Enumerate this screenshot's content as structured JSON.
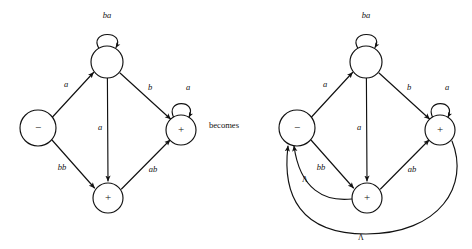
{
  "figure": {
    "connector_text": "becomes",
    "stroke_color": "#111111",
    "background_color": "#ffffff"
  },
  "left_automaton": {
    "name": "original-automaton",
    "nodes": [
      {
        "id": "start",
        "label": "−",
        "cx": 38,
        "cy": 128,
        "r": 18
      },
      {
        "id": "top",
        "label": "",
        "cx": 107,
        "cy": 62,
        "r": 16
      },
      {
        "id": "right",
        "label": "+",
        "cx": 181,
        "cy": 130,
        "r": 15
      },
      {
        "id": "bottom",
        "label": "+",
        "cx": 108,
        "cy": 198,
        "r": 15
      }
    ],
    "edges": [
      {
        "id": "top-self",
        "label": "ba",
        "label_x": 107,
        "label_y": 16
      },
      {
        "id": "start-top",
        "label": "a",
        "label_x": 66,
        "label_y": 85
      },
      {
        "id": "top-right",
        "label": "b",
        "label_x": 150,
        "label_y": 88
      },
      {
        "id": "right-self",
        "label": "a",
        "label_x": 188,
        "label_y": 88
      },
      {
        "id": "top-bottom",
        "label": "a",
        "label_x": 100,
        "label_y": 128
      },
      {
        "id": "start-bottom",
        "label": "bb",
        "label_x": 62,
        "label_y": 168
      },
      {
        "id": "bottom-right",
        "label": "ab",
        "label_x": 153,
        "label_y": 170
      }
    ]
  },
  "right_automaton": {
    "name": "transformed-automaton",
    "nodes": [
      {
        "id": "start",
        "label": "−",
        "cx": 297,
        "cy": 128,
        "r": 18
      },
      {
        "id": "top",
        "label": "",
        "cx": 366,
        "cy": 62,
        "r": 16
      },
      {
        "id": "right",
        "label": "+",
        "cx": 440,
        "cy": 130,
        "r": 15
      },
      {
        "id": "bottom",
        "label": "+",
        "cx": 367,
        "cy": 198,
        "r": 15
      }
    ],
    "edges": [
      {
        "id": "top-self",
        "label": "ba",
        "label_x": 366,
        "label_y": 16
      },
      {
        "id": "start-top",
        "label": "a",
        "label_x": 325,
        "label_y": 85
      },
      {
        "id": "top-right",
        "label": "b",
        "label_x": 409,
        "label_y": 88
      },
      {
        "id": "right-self",
        "label": "a",
        "label_x": 447,
        "label_y": 88
      },
      {
        "id": "top-bottom",
        "label": "a",
        "label_x": 359,
        "label_y": 128
      },
      {
        "id": "start-bottom",
        "label": "bb",
        "label_x": 321,
        "label_y": 168
      },
      {
        "id": "bottom-right",
        "label": "ab",
        "label_x": 412,
        "label_y": 170
      },
      {
        "id": "bottom-start-lambda",
        "label": "Λ",
        "label_x": 305,
        "label_y": 180
      },
      {
        "id": "right-start-lambda",
        "label": "Λ",
        "label_x": 361,
        "label_y": 238
      }
    ]
  }
}
